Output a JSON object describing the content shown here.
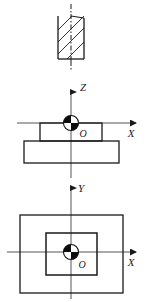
{
  "drawing": {
    "type": "engineering-orthographic-projection",
    "description": "Three-view technical drawing of a stepped rectangular block with coordinate origin markers",
    "stroke_color": "#1a1a1a",
    "fill_color": "#ffffff",
    "background_color": "#ffffff",
    "views": [
      {
        "id": "section-view",
        "name": "sectioned-tool-view",
        "kind": "cross-section",
        "hatch_angle_degrees": 45,
        "hatch_line_count": 4,
        "has_centerline": true,
        "centerline_style": "dash-dot",
        "body": {
          "x": 58,
          "y": 16,
          "width": 26,
          "height": 43
        },
        "labels": []
      },
      {
        "id": "front-view",
        "name": "front-elevation-zx",
        "kind": "elevation",
        "axes": [
          {
            "name": "Z",
            "direction": "up",
            "label": "Z"
          },
          {
            "name": "X",
            "direction": "right",
            "label": "X"
          }
        ],
        "origin_label": "O",
        "shapes": [
          {
            "name": "upper-step",
            "x": 40,
            "y": 123,
            "width": 62,
            "height": 18
          },
          {
            "name": "lower-base",
            "x": 24,
            "y": 141,
            "width": 95,
            "height": 22
          }
        ]
      },
      {
        "id": "top-view",
        "name": "top-plan-xy",
        "kind": "plan",
        "axes": [
          {
            "name": "Y",
            "direction": "up",
            "label": "Y"
          },
          {
            "name": "X",
            "direction": "right",
            "label": "X"
          }
        ],
        "origin_label": "O",
        "shapes": [
          {
            "name": "outer-outline",
            "x": 20,
            "y": 215,
            "width": 103,
            "height": 78
          },
          {
            "name": "inner-outline",
            "x": 46,
            "y": 233,
            "width": 51,
            "height": 42
          }
        ]
      }
    ],
    "axis_labels": {
      "z_front": "Z",
      "x_front": "X",
      "y_top": "Y",
      "x_top": "X"
    },
    "origin_labels": {
      "front": "O",
      "top": "O"
    },
    "origin_marker": {
      "name": "coordinate-origin-symbol",
      "radius": 7,
      "filled_quadrants": [
        "upper-left",
        "lower-right"
      ],
      "fill": "#0d0d0d",
      "empty_fill": "#ffffff"
    }
  }
}
